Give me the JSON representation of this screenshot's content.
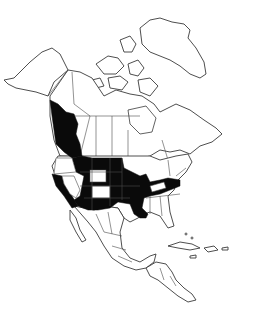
{
  "map": {
    "type": "species-range-map",
    "region": "North America",
    "colors": {
      "background": "#ffffff",
      "outline": "#3a3a3a",
      "range_fill": "#0a0a0a"
    },
    "legend": null,
    "labels": [],
    "shaded_regions": [
      "British Columbia",
      "Washington (east)",
      "Idaho",
      "Montana",
      "North Dakota",
      "South Dakota",
      "Nebraska",
      "Kansas",
      "Oklahoma",
      "Texas (north-east)",
      "Arkansas",
      "Louisiana (west)",
      "Missouri",
      "Iowa",
      "Illinois (south)",
      "Indiana",
      "Ohio",
      "Kentucky",
      "West Virginia",
      "Virginia",
      "California",
      "Arizona",
      "Utah (parts)",
      "New Mexico",
      "Colorado (east)"
    ],
    "unshaded_within_range": [
      "Oregon",
      "Nevada",
      "Wyoming",
      "Colorado (west)"
    ]
  }
}
